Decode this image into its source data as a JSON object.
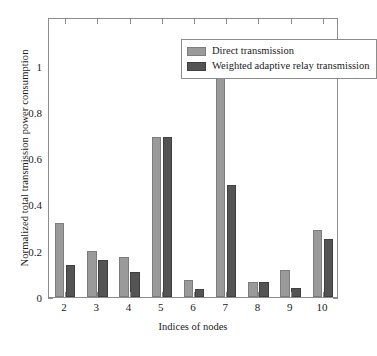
{
  "chart_data": {
    "type": "bar",
    "title": "",
    "xlabel": "Indices of nodes",
    "ylabel": "Normalized total transmission power consumption",
    "categories": [
      "2",
      "3",
      "4",
      "5",
      "6",
      "7",
      "8",
      "9",
      "10"
    ],
    "series": [
      {
        "name": "Direct transmission",
        "color": "#9a9a9a",
        "values": [
          0.32,
          0.2,
          0.175,
          0.69,
          0.075,
          1.0,
          0.063,
          0.115,
          0.29
        ]
      },
      {
        "name": "Weighted adaptive relay transmission",
        "color": "#545454",
        "values": [
          0.14,
          0.16,
          0.11,
          0.69,
          0.035,
          0.485,
          0.063,
          0.04,
          0.25
        ]
      }
    ],
    "ylim": [
      0,
      1.21
    ],
    "yticks": [
      0,
      0.2,
      0.4,
      0.6,
      0.8,
      1
    ],
    "ytick_labels": [
      "0",
      "0.2",
      "0.4",
      "0.6",
      "0.8",
      "1"
    ],
    "grid": false,
    "legend_position": "top-center"
  }
}
